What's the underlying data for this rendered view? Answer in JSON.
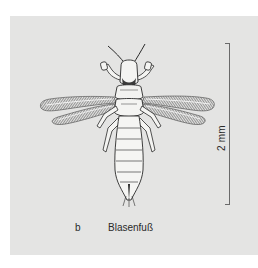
{
  "figure": {
    "caption_letter": "b",
    "caption_name": "Blasenfuß",
    "scale_label": "2 mm"
  },
  "colors": {
    "panel_background": "#e4e4e3",
    "page_background": "#ffffff",
    "ink": "#2a2a2a"
  }
}
